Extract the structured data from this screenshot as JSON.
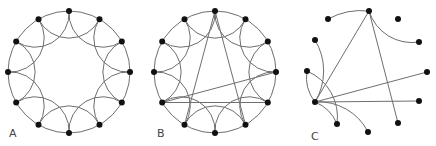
{
  "figure": {
    "panels": [
      {
        "label": "A",
        "description": "Regular ring lattice: 12 nodes, each linked to nearest and next-nearest neighbors",
        "center": [
          69,
          72
        ],
        "radius": 61,
        "node_count": 12,
        "label_pos": [
          9,
          131
        ]
      },
      {
        "label": "B",
        "description": "Small-world network: ring lattice with a few random long-range shortcuts",
        "center": [
          215,
          72
        ],
        "radius": 61,
        "node_count": 12,
        "label_pos": [
          157,
          131
        ],
        "shortcuts": [
          [
            0,
            7
          ],
          [
            0,
            5
          ],
          [
            8,
            3
          ],
          [
            8,
            4
          ]
        ]
      },
      {
        "label": "C",
        "description": "Random-like network derived from the ring, with hub nodes",
        "node_count": 13,
        "label_pos": [
          311,
          133
        ]
      }
    ],
    "colors": {
      "edge": "#6e6e6e",
      "node": "#111111",
      "label": "#444444"
    }
  }
}
